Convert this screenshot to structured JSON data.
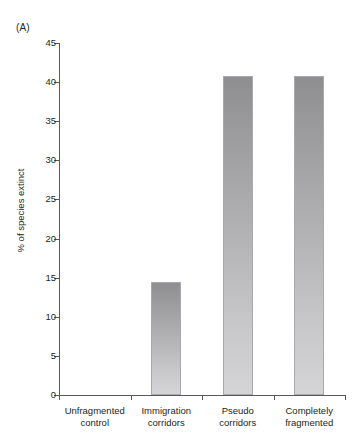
{
  "panel_label": "(A)",
  "chart_data": {
    "type": "bar",
    "title": "",
    "subtitle": "",
    "xlabel": "",
    "ylabel": "% of species extinct",
    "categories": [
      "Unfragmented control",
      "Immigration corridors",
      "Pseudo corridors",
      "Completely fragmented"
    ],
    "category_lines": [
      [
        "Unfragmented",
        "control"
      ],
      [
        "Immigration",
        "corridors"
      ],
      [
        "Pseudo",
        "corridors"
      ],
      [
        "Completely",
        "fragmented"
      ]
    ],
    "values": [
      0,
      14.5,
      40.8,
      40.8
    ],
    "ylim": [
      0,
      45
    ],
    "ytick_values": [
      0,
      5,
      10,
      15,
      20,
      25,
      30,
      35,
      40,
      45
    ],
    "ytick_labels": [
      "0",
      "5",
      "10",
      "15",
      "20",
      "25",
      "30",
      "35",
      "40",
      "45"
    ],
    "grid": false,
    "legend": null,
    "bar_color_top": "#8e8e90",
    "bar_color_bottom": "#d4d4d6",
    "bar_border_color": "#a7a9ac",
    "axis_color": "#58595b",
    "text_color": "#231f20"
  }
}
